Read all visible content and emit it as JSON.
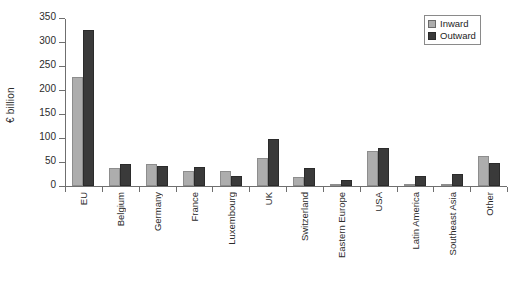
{
  "chart_data": {
    "type": "bar",
    "title": "",
    "xlabel": "",
    "ylabel": "€ billion",
    "ylim": [
      0,
      350
    ],
    "ytick_values": [
      0,
      50,
      100,
      150,
      200,
      250,
      300,
      350
    ],
    "ytick_labels": [
      "0",
      "50",
      "100",
      "150",
      "200",
      "250",
      "300",
      "350"
    ],
    "grid": false,
    "legend_position": "top-right",
    "categories": [
      "EU",
      "Belgium",
      "Germany",
      "France",
      "Luxembourg",
      "UK",
      "Switzerland",
      "Eastern Europe",
      "USA",
      "Latin America",
      "Southeast Asia",
      "Other"
    ],
    "series": [
      {
        "name": "Inward",
        "color": "#adadad",
        "values": [
          228,
          37,
          45,
          31,
          31,
          59,
          18,
          1,
          72,
          0,
          2,
          62
        ]
      },
      {
        "name": "Outward",
        "color": "#3a3a3a",
        "values": [
          326,
          46,
          42,
          39,
          20,
          97,
          38,
          13,
          80,
          20,
          25,
          47
        ]
      }
    ]
  },
  "legend": {
    "items": [
      {
        "label": "Inward",
        "swatch": "inward-swatch"
      },
      {
        "label": "Outward",
        "swatch": "outward-swatch"
      }
    ]
  }
}
